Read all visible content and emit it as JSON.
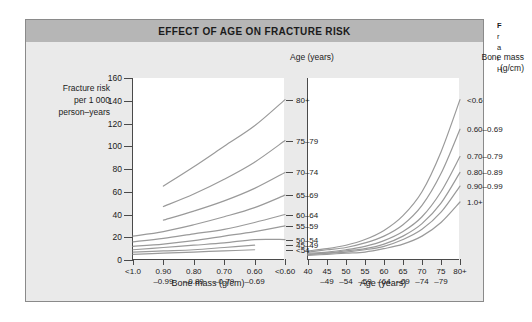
{
  "figure": {
    "title": "EFFECT OF AGE ON FRACTURE RISK",
    "title_bg": "#b6b6b6",
    "panel_bg": "#ffffff",
    "frame_bg": "#eaeaea",
    "curve_color": "#9a9a9a",
    "axis_color": "#4a4a4a"
  },
  "caption": {
    "line1": "F",
    "line2": "r",
    "line3": "a",
    "line4": "i",
    "line5": "H"
  },
  "y_axis": {
    "label_line1": "Fracture risk",
    "label_line2": "per 1 000",
    "label_line3": "person–years",
    "ticks": [
      "160",
      "140",
      "120",
      "100",
      "80",
      "60",
      "40",
      "20",
      "0"
    ],
    "min": 0,
    "max": 160
  },
  "left_panel": {
    "axis_title": "Bone mass (g/cm)",
    "legend_title_line1": "Age (years)",
    "x_ticks": [
      {
        "top": "<1.0",
        "bottom": ""
      },
      {
        "top": "0.90",
        "bottom": "–0.99"
      },
      {
        "top": "0.80",
        "bottom": "–0.89"
      },
      {
        "top": "0.70",
        "bottom": "–0.79"
      },
      {
        "top": "0.60",
        "bottom": "–0.69"
      },
      {
        "top": "<0.60",
        "bottom": ""
      }
    ],
    "legend_items": [
      "80+",
      "75–79",
      "70–74",
      "65–69",
      "60–64",
      "55–59",
      "50–54",
      "45–49",
      "<54"
    ]
  },
  "right_panel": {
    "axis_title": "Age (years)",
    "legend_title_line1": "Bone mass",
    "legend_title_line2": "(g/cm)",
    "x_ticks": [
      {
        "top": "40",
        "bottom": ""
      },
      {
        "top": "45",
        "bottom": "–49"
      },
      {
        "top": "50",
        "bottom": "–54"
      },
      {
        "top": "55",
        "bottom": "–59"
      },
      {
        "top": "60",
        "bottom": "–64"
      },
      {
        "top": "65",
        "bottom": "–69"
      },
      {
        "top": "70",
        "bottom": "–74"
      },
      {
        "top": "75",
        "bottom": "–79"
      },
      {
        "top": "80+",
        "bottom": ""
      }
    ],
    "legend_items": [
      "<0.6",
      "0.60–0.69",
      "0.70–0.79",
      "0.80–0.89",
      "0.90–0.99",
      "1.0+"
    ]
  },
  "chart_data": [
    {
      "type": "line",
      "title": "EFFECT OF AGE ON FRACTURE RISK — left panel",
      "xlabel": "Bone mass (g/cm)",
      "ylabel": "Fracture risk per 1 000 person–years",
      "ylim": [
        0,
        160
      ],
      "grid": false,
      "legend_position": "right",
      "legend_title": "Age (years)",
      "categories": [
        "<1.0",
        "0.90–0.99",
        "0.80–0.89",
        "0.70–0.79",
        "0.60–0.69",
        "<0.60"
      ],
      "series": [
        {
          "name": "80+",
          "values": [
            null,
            65,
            82,
            100,
            118,
            141
          ]
        },
        {
          "name": "75–79",
          "values": [
            null,
            47,
            58,
            71,
            86,
            105
          ]
        },
        {
          "name": "70–74",
          "values": [
            null,
            35,
            43,
            52,
            63,
            77
          ]
        },
        {
          "name": "65–69",
          "values": [
            21,
            25,
            31,
            38,
            46,
            57
          ]
        },
        {
          "name": "60–64",
          "values": [
            16,
            19,
            23,
            27,
            33,
            40
          ]
        },
        {
          "name": "55–59",
          "values": [
            12,
            14,
            17,
            21,
            25,
            30
          ]
        },
        {
          "name": "50–54",
          "values": [
            9,
            11,
            13,
            15,
            18,
            18
          ]
        },
        {
          "name": "45–49",
          "values": [
            7,
            8,
            9,
            11,
            13,
            null
          ]
        },
        {
          "name": "<54",
          "values": [
            5,
            6,
            7,
            8,
            9,
            null
          ]
        }
      ]
    },
    {
      "type": "line",
      "title": "EFFECT OF AGE ON FRACTURE RISK — right panel",
      "xlabel": "Age (years)",
      "ylabel": "Fracture risk per 1 000 person–years",
      "ylim": [
        0,
        160
      ],
      "grid": false,
      "legend_position": "right",
      "legend_title": "Bone mass (g/cm)",
      "categories": [
        "40",
        "45–49",
        "50–54",
        "55–59",
        "60–64",
        "65–69",
        "70–74",
        "75–79",
        "80+"
      ],
      "series": [
        {
          "name": "<0.6",
          "values": [
            8,
            10,
            13,
            18,
            26,
            39,
            60,
            95,
            141
          ]
        },
        {
          "name": "0.60–0.69",
          "values": [
            7,
            9,
            11,
            15,
            21,
            31,
            48,
            76,
            115
          ]
        },
        {
          "name": "0.70–0.79",
          "values": [
            6,
            7,
            9,
            12,
            17,
            25,
            38,
            60,
            91
          ]
        },
        {
          "name": "0.80–0.89",
          "values": [
            5,
            6,
            8,
            10,
            14,
            21,
            32,
            50,
            77
          ]
        },
        {
          "name": "0.90–0.99",
          "values": [
            5,
            6,
            7,
            9,
            12,
            18,
            27,
            42,
            65
          ]
        },
        {
          "name": "1.0+",
          "values": [
            4,
            5,
            6,
            7,
            10,
            14,
            21,
            33,
            51
          ]
        }
      ]
    }
  ]
}
